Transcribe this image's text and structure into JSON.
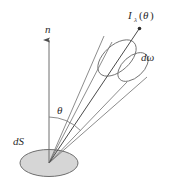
{
  "figure": {
    "background_color": "#ffffff",
    "width": 171,
    "height": 182,
    "labels": {
      "normal": "n",
      "angle": "θ",
      "surface_element": "dS",
      "solid_angle": "dω",
      "radiance_symbol": "I",
      "radiance_subscript": "λ",
      "radiance_open_paren": "(",
      "radiance_argument": "θ",
      "radiance_close_paren": ")",
      "radiance_full": "Iλ(θ)"
    },
    "colors": {
      "stroke": "#555555",
      "stroke_light": "#8c8c8c",
      "surface_fill": "#d6d6d6",
      "surface_stroke": "#6e6e6e",
      "text": "#2b2b2b",
      "ray": "#4a4a4a"
    },
    "geometry": {
      "origin_x": 49,
      "origin_y": 163,
      "surface_rx": 29,
      "surface_ry": 13,
      "normal_tip_y": 36,
      "theta_arc_radius": 46,
      "cone_axis_angle_deg": 43,
      "ray_tip_x": 139,
      "ray_tip_y": 28
    }
  }
}
